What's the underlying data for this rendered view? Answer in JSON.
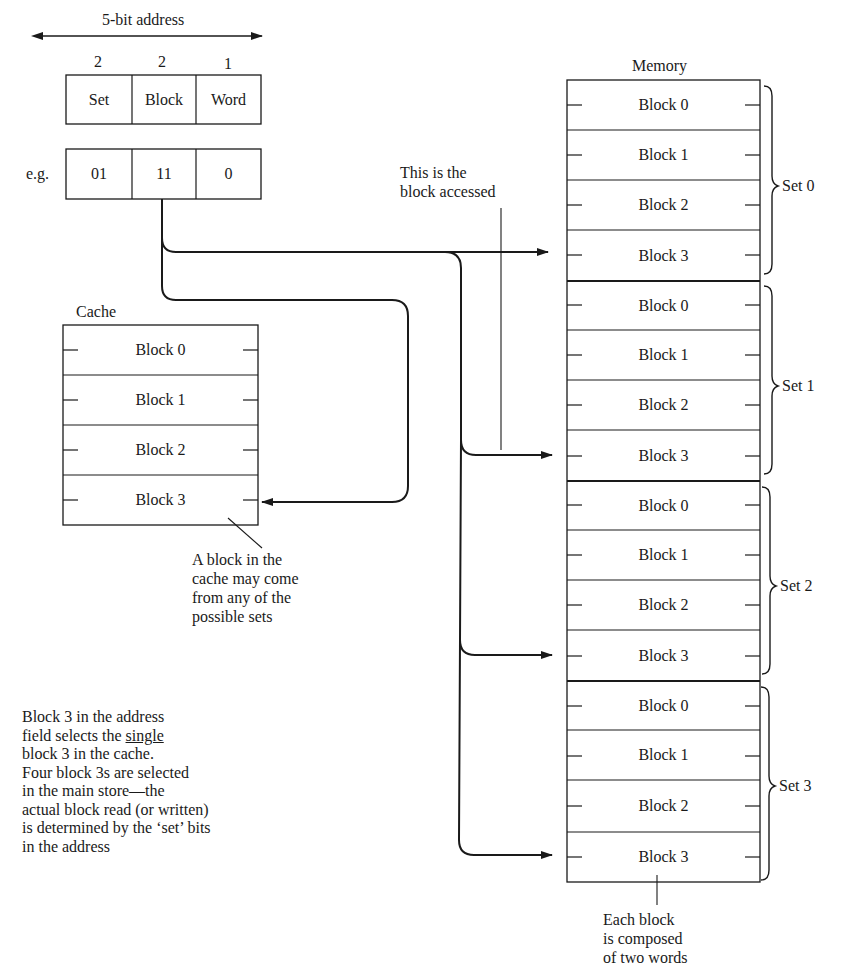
{
  "address": {
    "title": "5-bit address",
    "bit_counts": [
      "2",
      "2",
      "1"
    ],
    "fields": [
      "Set",
      "Block",
      "Word"
    ],
    "example_label": "e.g.",
    "example_values": [
      "01",
      "11",
      "0"
    ]
  },
  "cache": {
    "title": "Cache",
    "blocks": [
      "Block 0",
      "Block 1",
      "Block 2",
      "Block 3"
    ],
    "highlighted_block_index": 3
  },
  "memory": {
    "title": "Memory",
    "sets": [
      {
        "label": "Set 0",
        "blocks": [
          "Block 0",
          "Block 1",
          "Block 2",
          "Block 3"
        ]
      },
      {
        "label": "Set 1",
        "blocks": [
          "Block 0",
          "Block 1",
          "Block 2",
          "Block 3"
        ]
      },
      {
        "label": "Set 2",
        "blocks": [
          "Block 0",
          "Block 1",
          "Block 2",
          "Block 3"
        ]
      },
      {
        "label": "Set 3",
        "blocks": [
          "Block 0",
          "Block 1",
          "Block 2",
          "Block 3"
        ]
      }
    ]
  },
  "annotations": {
    "block_accessed": [
      "This is the",
      "block accessed"
    ],
    "cache_origin": [
      "A block in the",
      "cache may come",
      "from any of the",
      "possible sets"
    ],
    "explanation": {
      "line1": "Block 3 in the address",
      "line2_pre": "field selects the ",
      "line2_underlined": "single",
      "line3": "block 3 in the cache.",
      "line4": "Four block 3s are selected",
      "line5": "in the main store—the",
      "line6": "actual block read (or written)",
      "line7": "is determined by the ‘set’ bits",
      "line8": "in the address"
    },
    "block_words": [
      "Each block",
      "is composed",
      "of two words"
    ]
  }
}
